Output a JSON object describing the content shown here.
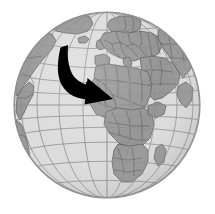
{
  "figure": {
    "name": "world-globe-with-migration-arrow",
    "description": "Grayscale orthographic globe centred on Africa and Europe with a bold black curved arrow sweeping from the North Atlantic toward North Africa",
    "width": 215,
    "height": 214
  },
  "globe": {
    "projection": "orthographic",
    "center_x": 107,
    "center_y": 105,
    "radius": 93,
    "center_lat": 10,
    "center_lon": 20,
    "ocean_color": "#dcdcdc",
    "ocean_color_shaded": "#c4c4c4",
    "land_color": "#969696",
    "land_color_shaded": "#8a8a8a",
    "border_color": "#555555",
    "outline_color": "#8e8e8e",
    "graticule_color": "#8c8c8c",
    "graticule_spacing_degrees": 15,
    "background_color": "#ffffff"
  },
  "arrow": {
    "name": "curved-migration-arrow",
    "color": "#000000",
    "tail_x": 60,
    "tail_y": 48,
    "head_tip_x": 113,
    "head_tip_y": 99,
    "direction": "from north atlantic south-east to north africa",
    "label": ""
  },
  "labels": {
    "continents": [],
    "annotations": []
  }
}
